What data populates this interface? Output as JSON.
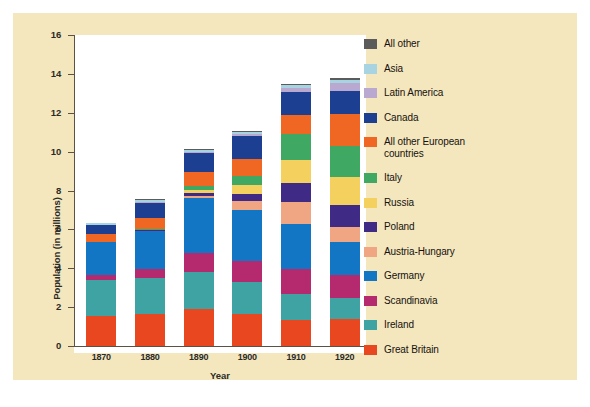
{
  "chart_data": {
    "type": "bar",
    "stacked": true,
    "title": "",
    "xlabel": "Year",
    "ylabel": "Population (in millions)",
    "ylim": [
      0,
      16
    ],
    "yticks": [
      0,
      2,
      4,
      6,
      8,
      10,
      12,
      14,
      16
    ],
    "grid": false,
    "legend_position": "right",
    "categories": [
      "1870",
      "1880",
      "1890",
      "1900",
      "1910",
      "1920"
    ],
    "series": [
      {
        "name": "Great Britain",
        "color": "#e8471f",
        "values": [
          1.55,
          1.65,
          1.9,
          1.65,
          1.35,
          1.4
        ]
      },
      {
        "name": "Ireland",
        "color": "#3fa3a3",
        "values": [
          1.85,
          1.85,
          1.9,
          1.65,
          1.35,
          1.05
        ]
      },
      {
        "name": "Scandinavia",
        "color": "#b52a6e",
        "values": [
          0.25,
          0.45,
          1.0,
          1.05,
          1.25,
          1.2
        ]
      },
      {
        "name": "Germany",
        "color": "#1376c4",
        "values": [
          1.7,
          1.97,
          2.8,
          2.66,
          2.31,
          1.69
        ]
      },
      {
        "name": "Austria-Hungary",
        "color": "#f0a583",
        "values": [
          0.0,
          0.0,
          0.12,
          0.43,
          1.17,
          0.8
        ]
      },
      {
        "name": "Poland",
        "color": "#3f2b86",
        "values": [
          0.0,
          0.05,
          0.15,
          0.4,
          0.94,
          1.14
        ]
      },
      {
        "name": "Russia",
        "color": "#f4d15e",
        "values": [
          0.0,
          0.0,
          0.18,
          0.43,
          1.18,
          1.4
        ]
      },
      {
        "name": "Italy",
        "color": "#3fa862",
        "values": [
          0.0,
          0.04,
          0.19,
          0.5,
          1.35,
          1.61
        ]
      },
      {
        "name": "All other European countries",
        "color": "#ef6723",
        "values": [
          0.4,
          0.6,
          0.72,
          0.85,
          0.98,
          1.67
        ]
      },
      {
        "name": "Canada",
        "color": "#1c3f91",
        "values": [
          0.5,
          0.75,
          0.95,
          1.2,
          1.2,
          1.15
        ]
      },
      {
        "name": "Latin America",
        "color": "#b9a8cf",
        "values": [
          0.0,
          0.05,
          0.06,
          0.08,
          0.22,
          0.45
        ]
      },
      {
        "name": "Asia",
        "color": "#a8d3e0",
        "values": [
          0.06,
          0.1,
          0.12,
          0.14,
          0.13,
          0.14
        ]
      },
      {
        "name": "All other",
        "color": "#5b5b5b",
        "values": [
          0.04,
          0.05,
          0.05,
          0.05,
          0.07,
          0.1
        ]
      }
    ],
    "totals": [
      6.0,
      7.0,
      9.2,
      10.5,
      13.5,
      14.7
    ]
  },
  "legend": {
    "entries": [
      {
        "label": "All other"
      },
      {
        "label": "Asia"
      },
      {
        "label": "Latin America"
      },
      {
        "label": "Canada"
      },
      {
        "label": "All other European\ncountries"
      },
      {
        "label": "Italy"
      },
      {
        "label": "Russia"
      },
      {
        "label": "Poland"
      },
      {
        "label": "Austria-Hungary"
      },
      {
        "label": "Germany"
      },
      {
        "label": "Scandinavia"
      },
      {
        "label": "Ireland"
      },
      {
        "label": "Great Britain"
      }
    ]
  },
  "axes": {
    "ylabel": "Population (in millions)",
    "xlabel": "Year",
    "ytick_labels": [
      "0",
      "2",
      "4",
      "6",
      "8",
      "10",
      "12",
      "14",
      "16"
    ],
    "xtick_labels": [
      "1870",
      "1880",
      "1890",
      "1900",
      "1910",
      "1920"
    ]
  },
  "colors": {
    "figure_background": "#f4e6bd",
    "plot_background": "#ffffff",
    "axis": "#5b5243",
    "text": "#2b2b28"
  }
}
